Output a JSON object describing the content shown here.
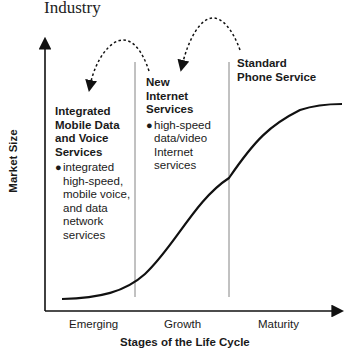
{
  "title": "Industry",
  "axes": {
    "y_label": "Market Size",
    "x_label": "Stages of the Life Cycle"
  },
  "stages": [
    "Emerging",
    "Growth",
    "Maturity"
  ],
  "panels": [
    {
      "heading_lines": [
        "Integrated",
        "Mobile Data",
        "and Voice",
        "Services"
      ],
      "bullet_lines": [
        "integrated",
        "high-speed,",
        "mobile voice,",
        "and data",
        "network",
        "services"
      ]
    },
    {
      "heading_lines": [
        "New",
        "Internet",
        "Services"
      ],
      "bullet_lines": [
        "high-speed",
        "data/video",
        "Internet",
        "services"
      ]
    },
    {
      "heading_lines": [
        "Standard",
        "Phone Service"
      ],
      "bullet_lines": []
    }
  ],
  "transitions": [
    {
      "from": "Standard Phone Service",
      "to": "New Internet Services"
    },
    {
      "from": "New Internet Services",
      "to": "Integrated Mobile Data and Voice Services"
    }
  ],
  "curve": {
    "type": "s-curve",
    "description": "market size grows slowly in emerging stage, rapidly in growth, levels off in maturity"
  }
}
